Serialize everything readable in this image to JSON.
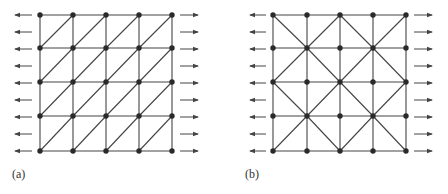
{
  "figure": {
    "panels": [
      {
        "id": "a",
        "label": "(a)",
        "grid": {
          "cols": 5,
          "rows": 5,
          "x": [
            40,
            73,
            106,
            139,
            172
          ],
          "y": [
            15,
            48,
            82,
            116,
            151
          ]
        },
        "diagonal_pattern": "uniform-right-leaning",
        "arrows": {
          "left_x": [
            15,
            32
          ],
          "right_x": [
            180,
            198
          ],
          "count_per_side": 9
        }
      },
      {
        "id": "b",
        "label": "(b)",
        "grid": {
          "cols": 5,
          "rows": 5,
          "x": [
            273,
            307,
            340,
            373,
            406
          ],
          "y": [
            15,
            48,
            82,
            116,
            151
          ]
        },
        "diagonal_pattern": "union-jack",
        "arrows": {
          "left_x": [
            250,
            266
          ],
          "right_x": [
            414,
            432
          ],
          "count_per_side": 9
        }
      }
    ],
    "colors": {
      "line": "#444444",
      "node": "#2a2a2a",
      "arrow": "#444444"
    }
  }
}
